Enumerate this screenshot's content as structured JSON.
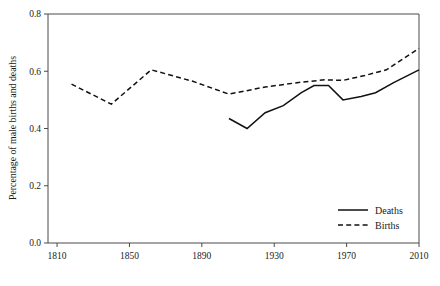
{
  "chart_data": {
    "type": "line",
    "title": "",
    "subtitle": "",
    "xlabel": "",
    "ylabel": "Percentage of male births and deaths",
    "xlim": [
      1805,
      2010
    ],
    "ylim": [
      0.0,
      0.8
    ],
    "xticks": [
      1810,
      1850,
      1890,
      1930,
      1970,
      2010
    ],
    "xtick_labels": [
      "1810",
      "1850",
      "1890",
      "1930",
      "1970",
      "2010"
    ],
    "yticks": [
      0.0,
      0.2,
      0.4,
      0.6,
      0.8
    ],
    "ytick_labels": [
      "0.0",
      "0.2",
      "0.4",
      "0.6",
      "0.8"
    ],
    "grid": false,
    "legend_position": "bottom-right",
    "series": [
      {
        "name": "Deaths",
        "style": "solid",
        "color": "#111111",
        "x": [
          1905,
          1915,
          1925,
          1935,
          1945,
          1952,
          1960,
          1968,
          1978,
          1986,
          1996,
          2010
        ],
        "values": [
          0.435,
          0.4,
          0.455,
          0.48,
          0.525,
          0.55,
          0.55,
          0.5,
          0.512,
          0.525,
          0.56,
          0.605
        ]
      },
      {
        "name": "Births",
        "style": "dashed",
        "color": "#111111",
        "x": [
          1818,
          1840,
          1862,
          1885,
          1905,
          1925,
          1945,
          1958,
          1968,
          1980,
          1992,
          2010
        ],
        "values": [
          0.555,
          0.485,
          0.605,
          0.565,
          0.52,
          0.545,
          0.562,
          0.57,
          0.568,
          0.585,
          0.605,
          0.68
        ]
      }
    ],
    "legend": [
      {
        "label": "Deaths",
        "style": "solid"
      },
      {
        "label": "Births",
        "style": "dashed"
      }
    ]
  }
}
